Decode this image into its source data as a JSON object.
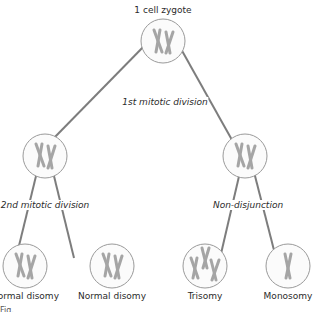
{
  "title": "1 cell zygote",
  "divisions": {
    "first": "1st mitotic division",
    "second": "2nd mitotic division",
    "nondisjunction": "Non-disjunction"
  },
  "outcomes": [
    {
      "label": "Normal disomy",
      "chromosomes": 2
    },
    {
      "label": "Normal disomy",
      "chromosomes": 2
    },
    {
      "label": "Trisomy",
      "chromosomes": 3
    },
    {
      "label": "Monosomy",
      "chromosomes": 1
    }
  ],
  "intermediate_cells": [
    {
      "name": "left-daughter-cell",
      "chromosomes": 2
    },
    {
      "name": "right-daughter-cell",
      "chromosomes": 2
    }
  ],
  "figure_caption": "Fig.",
  "colors": {
    "line": "#7a7a7a",
    "cell_border": "#9a9a9a",
    "chromosome": "#a9a9a9"
  }
}
